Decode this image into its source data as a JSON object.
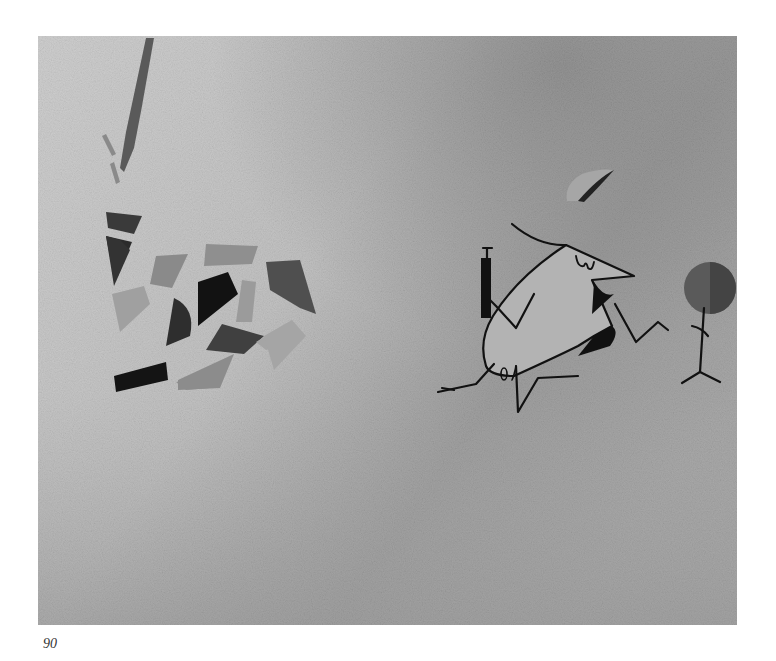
{
  "page": {
    "page_number": "90"
  },
  "illustration": {
    "description": "Grayscale textured painting: scattered colored glass-like shards on the left; a stylized cartoon figure with a cap holding a syringe and a round lollipop/balloon on the right; a dark streak at top left",
    "elements": [
      {
        "name": "brush-streak",
        "label": "dark vertical brush streak"
      },
      {
        "name": "shard-pile",
        "label": "scattered broken shards"
      },
      {
        "name": "cartoon-character",
        "label": "long-nosed figure with cap"
      },
      {
        "name": "syringe",
        "label": "syringe held in left hand"
      },
      {
        "name": "round-sign",
        "label": "round disc on a stick held in right hand"
      }
    ],
    "colors": {
      "background_light": "#c8c8c8",
      "background_dark": "#9a9a9a",
      "shard_dark": "#222222",
      "shard_mid": "#6a6a6a",
      "shard_light": "#a9a9a9",
      "body": "#b4b4b4",
      "outline": "#111111",
      "disc": "#555555"
    }
  }
}
